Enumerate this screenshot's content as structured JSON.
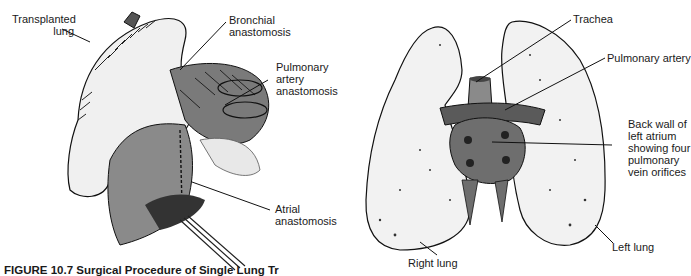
{
  "figure": {
    "caption": "FIGURE 10.7 Surgical Procedure of Single Lung Tr"
  },
  "left_panel": {
    "labels": {
      "transplanted_lung": [
        "Transplanted",
        "lung"
      ],
      "bronchial_anastomosis": [
        "Bronchial",
        "anastomosis"
      ],
      "pulmonary_artery_anastomosis": [
        "Pulmonary",
        "artery",
        "anastomosis"
      ],
      "atrial_anastomosis": [
        "Atrial",
        "anastomosis"
      ]
    }
  },
  "right_panel": {
    "labels": {
      "trachea": "Trachea",
      "pulmonary_artery": "Pulmonary artery",
      "back_wall": [
        "Back wall of",
        "left atrium",
        "showing four",
        "pulmonary",
        "vein orifices"
      ],
      "left_lung": "Left lung",
      "right_lung": "Right lung"
    }
  },
  "colors": {
    "ink": "#1a1a1a",
    "tissue_dark": "#6a6a6a",
    "tissue_mid": "#8c8c8c",
    "lung_fill": "#f2f2f2"
  }
}
